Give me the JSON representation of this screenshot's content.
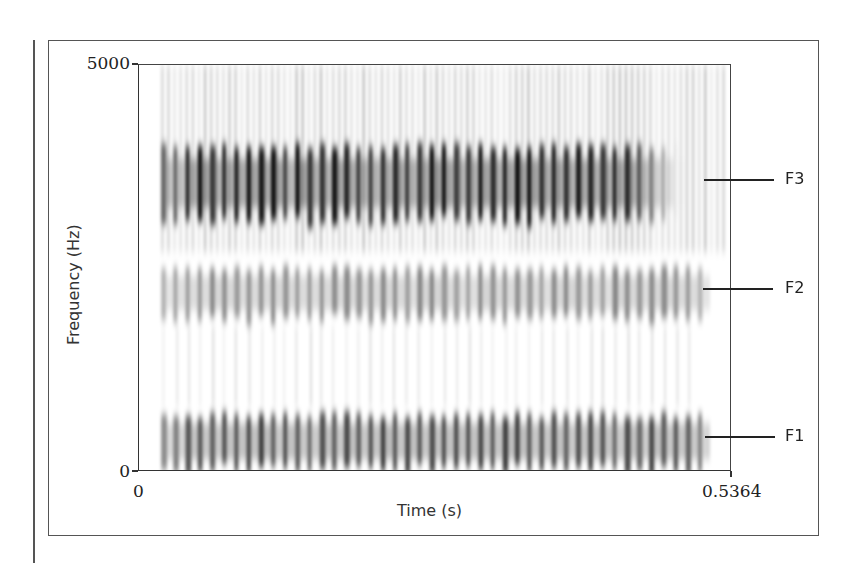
{
  "chart_data": {
    "type": "heatmap",
    "subtype": "spectrogram",
    "title": "",
    "xlabel": "Time (s)",
    "ylabel": "Frequency (Hz)",
    "xlim": [
      0,
      0.5364
    ],
    "ylim": [
      0,
      5000
    ],
    "x_ticks": [
      "0",
      "0.5364"
    ],
    "y_ticks": [
      "0",
      "5000"
    ],
    "colormap": "grayscale (dark = high energy)",
    "grid": false,
    "voicing": {
      "start_s": 0.02,
      "end_s": 0.495,
      "glottal_pulse_period_px": 12.2,
      "approx_pulses": 43
    },
    "formants": [
      {
        "name": "F1",
        "marker_hz": 430,
        "band_hz": [
          0,
          750
        ],
        "intensity": "strong"
      },
      {
        "name": "F2",
        "marker_hz": 2250,
        "band_hz": [
          1850,
          2550
        ],
        "intensity": "medium"
      },
      {
        "name": "F3",
        "marker_hz": 3590,
        "band_hz": [
          3050,
          4050
        ],
        "intensity": "strongest",
        "end_s": 0.44
      }
    ]
  },
  "axes": {
    "x": {
      "min_label": "0",
      "max_label": "0.5364",
      "title": "Time (s)"
    },
    "y": {
      "min_label": "0",
      "max_label": "5000",
      "title": "Frequency (Hz)"
    }
  },
  "labels": {
    "f1": "F1",
    "f2": "F2",
    "f3": "F3"
  }
}
